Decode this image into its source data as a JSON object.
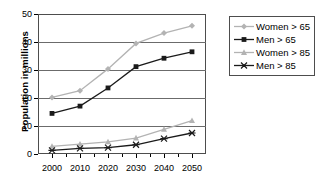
{
  "chart_data": {
    "type": "line",
    "title": "",
    "xlabel": "",
    "ylabel": "Population in millions",
    "x": [
      2000,
      2010,
      2020,
      2030,
      2040,
      2050
    ],
    "categories": [
      "2000",
      "2010",
      "2020",
      "2030",
      "2040",
      "2050"
    ],
    "xlim": [
      1995,
      2055
    ],
    "ylim": [
      0,
      50
    ],
    "yticks": [
      0,
      10,
      20,
      30,
      40,
      50
    ],
    "ytick_labels": [
      "0",
      "10",
      "20",
      "30",
      "40",
      "50"
    ],
    "grid": true,
    "legend_position": "right",
    "series": [
      {
        "name": "Women > 65",
        "values": [
          20.2,
          22.6,
          30.4,
          39.5,
          43.2,
          45.8
        ],
        "color": "#b3b3b3",
        "marker": "diamond"
      },
      {
        "name": "Men > 65",
        "values": [
          14.5,
          17.1,
          23.6,
          31.2,
          34.2,
          36.5
        ],
        "color": "#1a1a1a",
        "marker": "square"
      },
      {
        "name": "Women > 85",
        "values": [
          2.7,
          3.5,
          4.3,
          5.7,
          8.8,
          11.9
        ],
        "color": "#b3b3b3",
        "marker": "triangle"
      },
      {
        "name": "Men > 85",
        "values": [
          1.3,
          2.0,
          2.3,
          3.3,
          5.5,
          7.5
        ],
        "color": "#1a1a1a",
        "marker": "star"
      }
    ]
  }
}
